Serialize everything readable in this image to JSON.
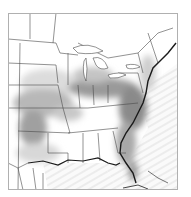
{
  "map": {
    "type": "shaded-field-map",
    "region": "Eastern United States",
    "frame": {
      "x": 8,
      "y": 13,
      "width": 170,
      "height": 177
    },
    "colors": {
      "background": "#ffffff",
      "frame": "#b0b0b0",
      "borders": "#4a4a4a",
      "ocean_stripes": "#eeeeee",
      "shade_light": "#d6d6d6",
      "shade_mid": "#a8a8a8",
      "shade_dark": "#7a7a7a",
      "coast_dark": "#1a1a1a"
    },
    "layers": [
      "state-borders",
      "coastline",
      "shaded-field",
      "ocean-stripes"
    ]
  }
}
